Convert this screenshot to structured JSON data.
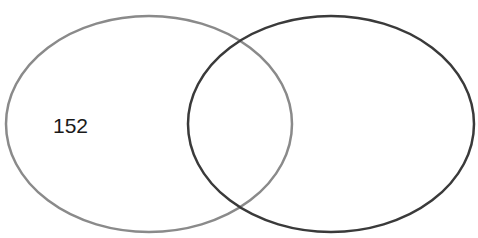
{
  "diagram": {
    "type": "venn",
    "sets": [
      {
        "id": "left",
        "stroke": "#8a8a8a",
        "cx": 149,
        "cy": 124,
        "rx": 143,
        "ry": 108,
        "label": "152"
      },
      {
        "id": "right",
        "stroke": "#3a3a3a",
        "cx": 331,
        "cy": 124,
        "rx": 143,
        "ry": 108,
        "label": ""
      }
    ]
  }
}
